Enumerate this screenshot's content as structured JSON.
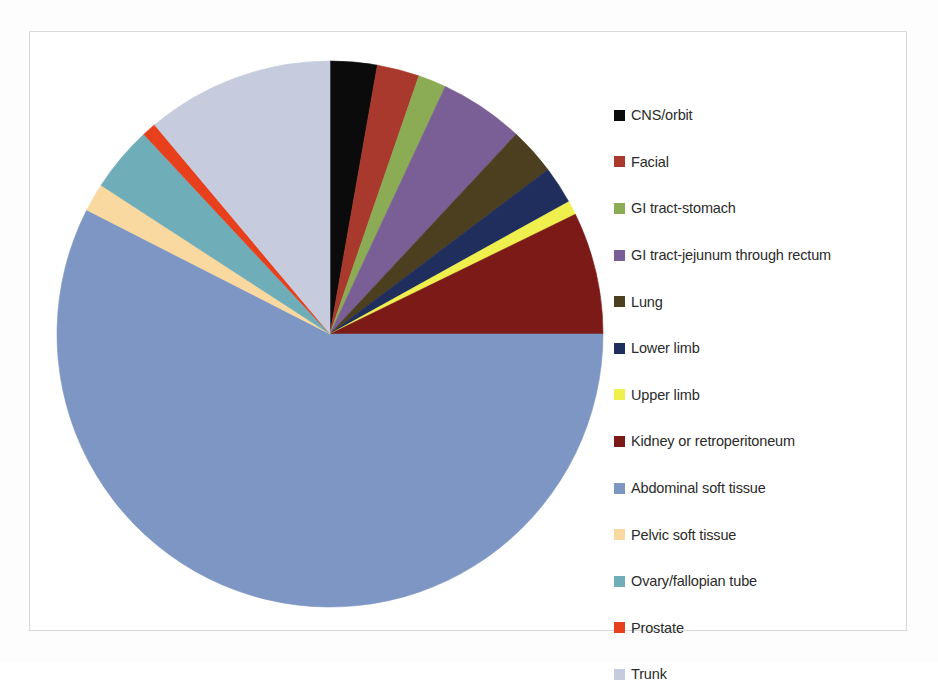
{
  "chart_data": {
    "type": "pie",
    "title": "",
    "subtitle": "",
    "xlabel": "",
    "ylabel": "",
    "legend_position": "right",
    "grid": false,
    "start_angle_deg": 0,
    "direction": "clockwise",
    "categories": [
      "CNS/orbit",
      "Facial",
      "GI tract-stomach",
      "GI tract-jejunum through rectum",
      "Lung",
      "Lower limb",
      "Upper limb",
      "Kidney or retroperitoneum",
      "Abdominal soft tissue",
      "Pelvic soft tissue",
      "Ovary/fallopian tube",
      "Prostate",
      "Trunk"
    ],
    "values": [
      2.8,
      2.5,
      1.7,
      5.0,
      2.8,
      2.2,
      0.8,
      7.2,
      57.5,
      1.7,
      3.9,
      0.8,
      11.1
    ],
    "value_unit": "percent",
    "colors": [
      "#0b0b0b",
      "#a8392c",
      "#8cab55",
      "#7a5e96",
      "#4b3f20",
      "#1f2e5c",
      "#eff04e",
      "#7b1a16",
      "#7d96c4",
      "#fad9a0",
      "#6fadb8",
      "#e8401c",
      "#c6ccde"
    ],
    "slices": [
      {
        "label": "CNS/orbit",
        "color": "#0b0b0b",
        "percent": 2.8,
        "start_deg": 0.0,
        "end_deg": 10.0
      },
      {
        "label": "Facial",
        "color": "#a8392c",
        "percent": 2.5,
        "start_deg": 10.0,
        "end_deg": 19.0
      },
      {
        "label": "GI tract-stomach",
        "color": "#8cab55",
        "percent": 1.7,
        "start_deg": 19.0,
        "end_deg": 25.0
      },
      {
        "label": "GI tract-jejunum through rectum",
        "color": "#7a5e96",
        "percent": 5.0,
        "start_deg": 25.0,
        "end_deg": 43.0
      },
      {
        "label": "Lung",
        "color": "#4b3f20",
        "percent": 2.8,
        "start_deg": 43.0,
        "end_deg": 53.0
      },
      {
        "label": "Lower limb",
        "color": "#1f2e5c",
        "percent": 2.2,
        "start_deg": 53.0,
        "end_deg": 61.0
      },
      {
        "label": "Upper limb",
        "color": "#eff04e",
        "percent": 0.8,
        "start_deg": 61.0,
        "end_deg": 64.0
      },
      {
        "label": "Kidney or retroperitoneum",
        "color": "#7b1a16",
        "percent": 7.2,
        "start_deg": 64.0,
        "end_deg": 90.0
      },
      {
        "label": "Abdominal soft tissue",
        "color": "#7d96c4",
        "percent": 57.5,
        "start_deg": 90.0,
        "end_deg": 297.0
      },
      {
        "label": "Pelvic soft tissue",
        "color": "#fad9a0",
        "percent": 1.7,
        "start_deg": 297.0,
        "end_deg": 303.0
      },
      {
        "label": "Ovary/fallopian tube",
        "color": "#6fadb8",
        "percent": 3.9,
        "start_deg": 303.0,
        "end_deg": 317.0
      },
      {
        "label": "Prostate",
        "color": "#e8401c",
        "percent": 0.8,
        "start_deg": 317.0,
        "end_deg": 320.0
      },
      {
        "label": "Trunk",
        "color": "#c6ccde",
        "percent": 11.1,
        "start_deg": 320.0,
        "end_deg": 360.0
      }
    ],
    "geometry": {
      "cx": 330,
      "cy": 334,
      "r": 273
    }
  },
  "legend": {
    "items": [
      {
        "label": "CNS/orbit",
        "color": "#0b0b0b"
      },
      {
        "label": "Facial",
        "color": "#a8392c"
      },
      {
        "label": "GI tract-stomach",
        "color": "#8cab55"
      },
      {
        "label": "GI tract-jejunum through rectum",
        "color": "#7a5e96"
      },
      {
        "label": "Lung",
        "color": "#4b3f20"
      },
      {
        "label": "Lower limb",
        "color": "#1f2e5c"
      },
      {
        "label": "Upper limb",
        "color": "#eff04e"
      },
      {
        "label": "Kidney or retroperitoneum",
        "color": "#7b1a16"
      },
      {
        "label": "Abdominal soft tissue",
        "color": "#7d96c4"
      },
      {
        "label": "Pelvic soft tissue",
        "color": "#fad9a0"
      },
      {
        "label": "Ovary/fallopian tube",
        "color": "#6fadb8"
      },
      {
        "label": "Prostate",
        "color": "#e8401c"
      },
      {
        "label": "Trunk",
        "color": "#c6ccde"
      }
    ]
  }
}
